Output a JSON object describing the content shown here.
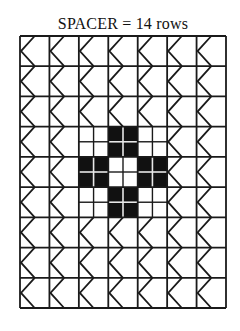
{
  "diagram": {
    "title": "SPACER = 14 rows",
    "grid": {
      "columns": 7,
      "rows": 9,
      "left": 20,
      "top": 36,
      "right": 226,
      "bottom": 308
    },
    "cell_motif": "chevron-left",
    "pattern_block": {
      "description": "3x3 checkered cross block, each cell subdivided 2x2",
      "col_start": 3,
      "row_start": 4,
      "cells": [
        [
          "white",
          "black",
          "white"
        ],
        [
          "black",
          "white",
          "black"
        ],
        [
          "white",
          "black",
          "white"
        ]
      ]
    },
    "colors": {
      "line": "#1a1a1a",
      "fill": "#111111",
      "background": "#ffffff",
      "subdivision_on_black": "#e8e8e8"
    }
  }
}
